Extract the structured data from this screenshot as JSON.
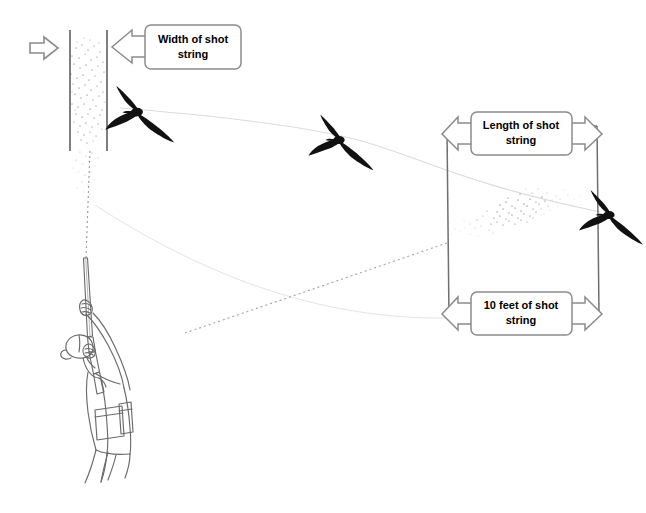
{
  "diagram": {
    "background_color": "#ffffff",
    "line_color": "#6b6b6b",
    "callout_border_color": "#8c8c8c",
    "callout_fill_color": "#ffffff",
    "text_color": "#000000",
    "pattern_color": "#3a3a3a",
    "bird_color": "#111111",
    "flight_path_color": "#dcdcdc",
    "sight_line_color": "#b5b5b5"
  },
  "callouts": [
    {
      "id": "width-of-shot-string",
      "line1": "Width of shot",
      "line2": "string",
      "arrow_style": "single-left"
    },
    {
      "id": "length-of-shot-string",
      "line1": "Length of shot",
      "line2": "string",
      "arrow_style": "double-horizontal"
    },
    {
      "id": "ten-feet-of-shot-string",
      "line1": "10 feet of shot",
      "line2": "string",
      "arrow_style": "double-horizontal"
    }
  ],
  "markers": [
    {
      "id": "incoming-direction-arrow",
      "shape": "arrow-right-outline"
    }
  ],
  "elements": {
    "pattern_board": {
      "label": "shot-pattern-frontal-view"
    },
    "shot_string_box": {
      "label": "shot-string-side-view"
    },
    "shooter": {
      "label": "hunter-with-shotgun"
    },
    "birds": [
      {
        "id": "bird-near",
        "label": "bird-silhouette"
      },
      {
        "id": "bird-mid",
        "label": "bird-silhouette"
      },
      {
        "id": "bird-far",
        "label": "bird-silhouette"
      }
    ]
  }
}
